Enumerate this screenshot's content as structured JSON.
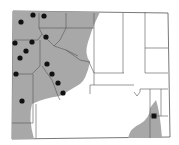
{
  "map": {
    "region": "Wyoming counties",
    "colors": {
      "range_fill": "#a8a8a8",
      "county_border": "#555555",
      "background": "#ffffff",
      "marker": "#111111"
    },
    "markers": {
      "dots": [
        {
          "x": 21,
          "y": 22
        },
        {
          "x": 33,
          "y": 15
        },
        {
          "x": 44,
          "y": 16
        },
        {
          "x": 46,
          "y": 37
        },
        {
          "x": 15,
          "y": 43
        },
        {
          "x": 32,
          "y": 42
        },
        {
          "x": 26,
          "y": 51
        },
        {
          "x": 20,
          "y": 58
        },
        {
          "x": 16,
          "y": 74
        },
        {
          "x": 47,
          "y": 64
        },
        {
          "x": 52,
          "y": 74
        },
        {
          "x": 58,
          "y": 83
        },
        {
          "x": 63,
          "y": 93
        },
        {
          "x": 22,
          "y": 101
        }
      ],
      "squares": [
        {
          "x": 154,
          "y": 116
        }
      ]
    }
  }
}
